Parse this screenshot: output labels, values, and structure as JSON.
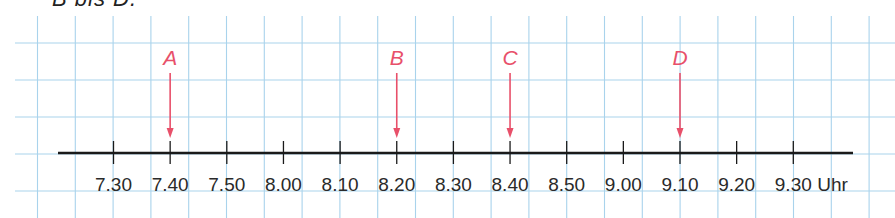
{
  "heading": "B bis D.",
  "chart_data": {
    "type": "number-line",
    "title": "B bis D.",
    "unit_label": "Uhr",
    "ticks": [
      "7.30",
      "7.40",
      "7.50",
      "8.00",
      "8.10",
      "8.20",
      "8.30",
      "8.40",
      "8.50",
      "9.00",
      "9.10",
      "9.20",
      "9.30"
    ],
    "tick_interval_minutes": 10,
    "markers": [
      {
        "label": "A",
        "time": "7.40"
      },
      {
        "label": "B",
        "time": "8.20"
      },
      {
        "label": "C",
        "time": "8.40"
      },
      {
        "label": "D",
        "time": "9.10"
      }
    ],
    "grid": true
  },
  "colors": {
    "grid": "#a9d3ec",
    "axis": "#1a1a1a",
    "marker": "#e8506a"
  }
}
